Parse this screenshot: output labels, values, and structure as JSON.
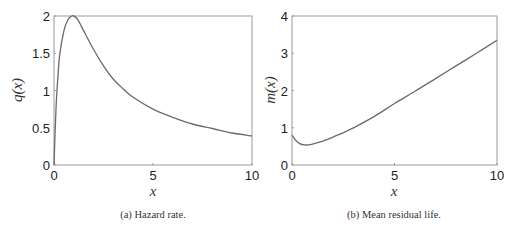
{
  "chart_data": [
    {
      "type": "line",
      "title": "",
      "caption": "(a) Hazard rate.",
      "xlabel": "x",
      "ylabel": "q(x)",
      "xlim": [
        0,
        10
      ],
      "ylim": [
        0,
        2
      ],
      "xticks": [
        "0",
        "5",
        "10"
      ],
      "yticks": [
        "0",
        "0.5",
        "1",
        "1.5",
        "2"
      ],
      "grid": false,
      "series": [
        {
          "name": "q(x)",
          "x": [
            0,
            0.1,
            0.2,
            0.3,
            0.5,
            0.7,
            0.9,
            1.0,
            1.2,
            1.5,
            2.0,
            2.5,
            3.0,
            3.5,
            4.0,
            5.0,
            6.0,
            7.0,
            8.0,
            9.0,
            10.0
          ],
          "y": [
            0,
            0.75,
            1.2,
            1.5,
            1.8,
            1.95,
            2.0,
            2.0,
            1.95,
            1.8,
            1.55,
            1.33,
            1.15,
            1.02,
            0.91,
            0.75,
            0.64,
            0.55,
            0.49,
            0.43,
            0.39
          ]
        }
      ]
    },
    {
      "type": "line",
      "title": "",
      "caption": "(b) Mean residual life.",
      "xlabel": "x",
      "ylabel": "m(x)",
      "xlim": [
        0,
        10
      ],
      "ylim": [
        0,
        4
      ],
      "xticks": [
        "0",
        "5",
        "10"
      ],
      "yticks": [
        "0",
        "1",
        "2",
        "3",
        "4"
      ],
      "grid": false,
      "series": [
        {
          "name": "m(x)",
          "x": [
            0,
            0.2,
            0.4,
            0.6,
            0.8,
            1.0,
            1.5,
            2.0,
            3.0,
            4.0,
            5.0,
            6.0,
            7.0,
            8.0,
            9.0,
            10.0
          ],
          "y": [
            0.8,
            0.65,
            0.57,
            0.54,
            0.54,
            0.56,
            0.64,
            0.75,
            1.0,
            1.3,
            1.65,
            1.98,
            2.32,
            2.66,
            3.0,
            3.35
          ]
        }
      ]
    }
  ]
}
